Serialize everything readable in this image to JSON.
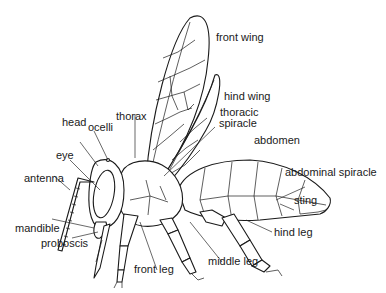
{
  "diagram": {
    "labels": {
      "front_wing": "front wing",
      "hind_wing": "hind wing",
      "thoracic_spiracle_1": "thoracic",
      "thoracic_spiracle_2": "spiracle",
      "thorax": "thorax",
      "head": "head",
      "ocelli": "ocelli",
      "abdomen": "abdomen",
      "eye": "eye",
      "abdominal_spiracle": "abdominal spiracle",
      "antenna": "antenna",
      "sting": "sting",
      "mandible": "mandible",
      "proboscis": "proboscis",
      "hind_leg": "hind leg",
      "front_leg": "front leg",
      "middle_leg": "middle leg"
    },
    "colors": {
      "ink": "#1a1a1a",
      "background": "#ffffff"
    }
  }
}
